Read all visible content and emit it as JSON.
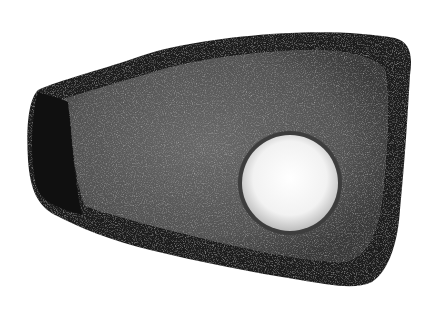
{
  "image": {
    "subject": "Perforated stone tool",
    "background_color": "#ffffff",
    "stone_edge_color": "#1a1a1a",
    "stone_face_color": "#5e5e5e",
    "hole_color": "#f6f6f6"
  }
}
